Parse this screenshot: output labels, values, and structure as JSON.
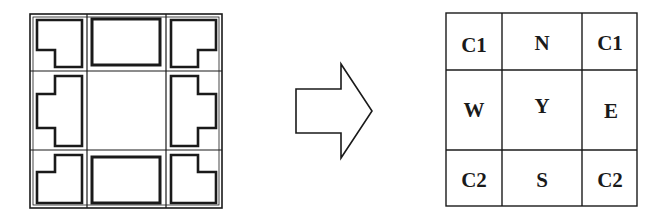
{
  "diagram": {
    "left_grid": {
      "description": "3x3 building footprint grid",
      "rows": 3,
      "cols": 3,
      "cells": [
        {
          "pos": "top-left",
          "shape": "corner-L"
        },
        {
          "pos": "top-center",
          "shape": "rectangle"
        },
        {
          "pos": "top-right",
          "shape": "corner-L"
        },
        {
          "pos": "middle-left",
          "shape": "side-T"
        },
        {
          "pos": "center",
          "shape": "empty"
        },
        {
          "pos": "middle-right",
          "shape": "side-T"
        },
        {
          "pos": "bottom-left",
          "shape": "corner-L"
        },
        {
          "pos": "bottom-center",
          "shape": "rectangle"
        },
        {
          "pos": "bottom-right",
          "shape": "corner-L"
        }
      ]
    },
    "arrow": {
      "direction": "right",
      "icon": "arrow-right-outline-icon"
    },
    "right_grid": {
      "rows": 3,
      "cols": 3,
      "labels": [
        [
          "C1",
          "N",
          "C1"
        ],
        [
          "W",
          "Y",
          "E"
        ],
        [
          "C2",
          "S",
          "C2"
        ]
      ]
    },
    "colors": {
      "stroke": "#1a1a1a",
      "background": "#ffffff"
    }
  }
}
